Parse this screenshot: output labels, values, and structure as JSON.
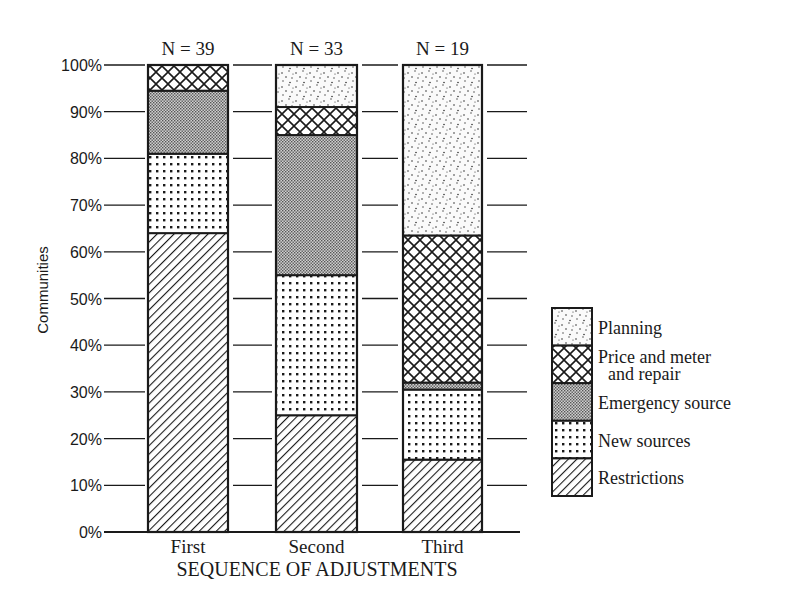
{
  "chart_data": {
    "type": "bar",
    "stacked": true,
    "percent": true,
    "title": "",
    "xlabel": "SEQUENCE OF ADJUSTMENTS",
    "ylabel": "Communities",
    "ylim": [
      0,
      100
    ],
    "yticks": [
      "0%",
      "10%",
      "20%",
      "30%",
      "40%",
      "50%",
      "60%",
      "70%",
      "80%",
      "90%",
      "100%"
    ],
    "categories": [
      "First",
      "Second",
      "Third"
    ],
    "annotations": [
      "N = 39",
      "N = 33",
      "N = 19"
    ],
    "series": [
      {
        "name": "Restrictions",
        "pattern": "diagonal-hatch",
        "values": [
          64,
          25,
          15.5
        ]
      },
      {
        "name": "New sources",
        "pattern": "grid-dots",
        "values": [
          17,
          30,
          15
        ]
      },
      {
        "name": "Emergency source",
        "pattern": "fine-gray-dots",
        "values": [
          13.5,
          30,
          1.5
        ]
      },
      {
        "name": "Price and meter and repair",
        "pattern": "crosshatch",
        "values": [
          5.5,
          6,
          31.5
        ]
      },
      {
        "name": "Planning",
        "pattern": "sparse-stipple",
        "values": [
          0,
          9,
          36.5
        ]
      }
    ],
    "grid": true,
    "legend_position": "right"
  },
  "legend": {
    "items": [
      {
        "label_lines": [
          "Planning"
        ],
        "pattern": "sparse-stipple"
      },
      {
        "label_lines": [
          "Price and meter",
          "and repair"
        ],
        "pattern": "crosshatch"
      },
      {
        "label_lines": [
          "Emergency source"
        ],
        "pattern": "fine-gray-dots"
      },
      {
        "label_lines": [
          "New sources"
        ],
        "pattern": "grid-dots"
      },
      {
        "label_lines": [
          "Restrictions"
        ],
        "pattern": "diagonal-hatch"
      }
    ]
  },
  "colors": {
    "ink": "#1a1a1a",
    "background": "#ffffff"
  }
}
